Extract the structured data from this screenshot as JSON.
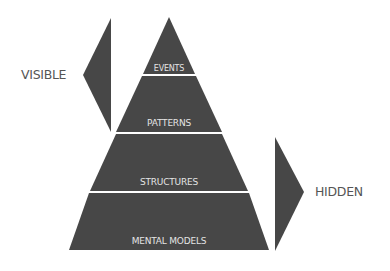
{
  "colors": {
    "shape_fill": "#474747",
    "divider": "#d8d8d8",
    "band_text": "#e4e4e4",
    "side_text": "#555555",
    "background": "#ffffff"
  },
  "pyramid": {
    "levels": [
      {
        "label": "EVENTS"
      },
      {
        "label": "PATTERNS"
      },
      {
        "label": "STRUCTURES"
      },
      {
        "label": "MENTAL MODELS"
      }
    ]
  },
  "indicators": {
    "visible": {
      "label": "VISIBLE",
      "direction": "left",
      "covers_levels": [
        "EVENTS",
        "PATTERNS"
      ]
    },
    "hidden": {
      "label": "HIDDEN",
      "direction": "right",
      "covers_levels": [
        "STRUCTURES",
        "MENTAL MODELS"
      ]
    }
  }
}
